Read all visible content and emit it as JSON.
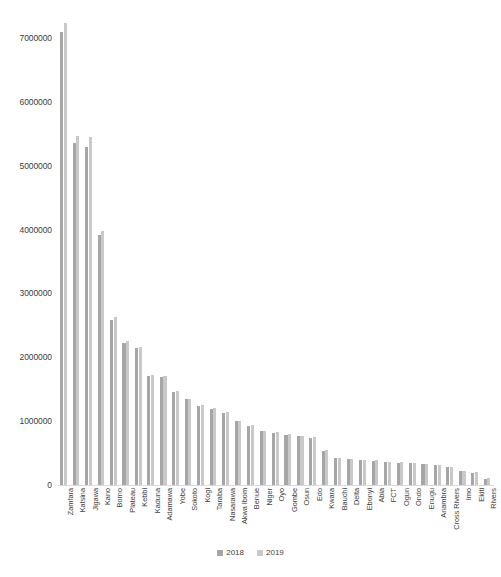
{
  "chart_data": {
    "type": "bar",
    "title": "",
    "subtitle": "",
    "xlabel": "",
    "ylabel": "",
    "ylim": [
      0,
      7500000
    ],
    "y_ticks": [
      0,
      1000000,
      2000000,
      3000000,
      4000000,
      5000000,
      6000000,
      7000000
    ],
    "y_tick_labels": [
      "0",
      "1000000",
      "2000000",
      "3000000",
      "4000000",
      "5000000",
      "6000000",
      "7000000"
    ],
    "grid": false,
    "legend_position": "bottom-center",
    "categories": [
      "Zamfara",
      "Katsina",
      "Jigawa",
      "Kano",
      "Borno",
      "Plateau",
      "Kebbi",
      "Kaduna",
      "Adamawa",
      "Yobe",
      "Sokoto",
      "Kogi",
      "Taraba",
      "Nasarawa",
      "Akwa Ibom",
      "Benue",
      "Niger",
      "Oyo",
      "Gombe",
      "Osun",
      "Edo",
      "Kwara",
      "Bauchi",
      "Delta",
      "Ebonyi",
      "Abia",
      "FCT",
      "Ogun",
      "Ondo",
      "Enugu",
      "Anambra",
      "Cross Rivers",
      "Imo",
      "Ekiti",
      "Rivers"
    ],
    "series": [
      {
        "name": "2018",
        "color": "#a6a6a6",
        "values": [
          7100000,
          5350000,
          5300000,
          3920000,
          2580000,
          2230000,
          2140000,
          1710000,
          1690000,
          1450000,
          1340000,
          1240000,
          1190000,
          1130000,
          1000000,
          930000,
          840000,
          820000,
          790000,
          760000,
          740000,
          540000,
          420000,
          400000,
          390000,
          380000,
          360000,
          350000,
          340000,
          330000,
          310000,
          280000,
          215000,
          195000,
          100000
        ]
      },
      {
        "name": "2019",
        "color": "#c9c9c9",
        "values": [
          7240000,
          5460000,
          5450000,
          3980000,
          2630000,
          2260000,
          2160000,
          1730000,
          1700000,
          1470000,
          1350000,
          1250000,
          1200000,
          1140000,
          1010000,
          940000,
          850000,
          830000,
          800000,
          770000,
          750000,
          550000,
          430000,
          410000,
          395000,
          385000,
          365000,
          355000,
          345000,
          335000,
          315000,
          285000,
          220000,
          200000,
          105000
        ]
      }
    ],
    "legend": [
      {
        "label": "2018",
        "color": "#a6a6a6"
      },
      {
        "label": "2019",
        "color": "#c9c9c9"
      }
    ]
  }
}
